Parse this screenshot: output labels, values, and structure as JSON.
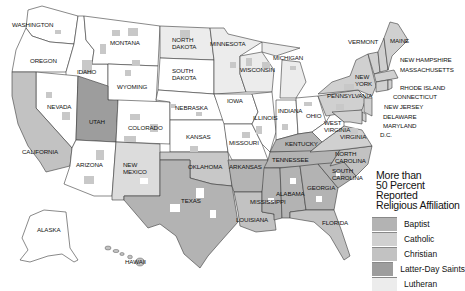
{
  "map": {
    "title": "More than 50 Percent Reported Religious Affiliation",
    "colors": {
      "background": "#ffffff",
      "base": "#ffffff",
      "baptist": "#b3b3b3",
      "catholic": "#d0d0d0",
      "christian": "#c2c2c2",
      "latter_day_saints": "#9d9d9d",
      "lutheran": "#ececec",
      "border": "#3a3a3a"
    },
    "state_labels": [
      {
        "name": "WASHINGTON",
        "x": 12,
        "y": 27
      },
      {
        "name": "OREGON",
        "x": 30,
        "y": 63
      },
      {
        "name": "IDAHO",
        "x": 77,
        "y": 74
      },
      {
        "name": "MONTANA",
        "x": 110,
        "y": 45
      },
      {
        "name": "WYOMING",
        "x": 117,
        "y": 89
      },
      {
        "name": "NEVADA",
        "x": 47,
        "y": 109
      },
      {
        "name": "UTAH",
        "x": 89,
        "y": 124
      },
      {
        "name": "CALIFORNIA",
        "x": 22,
        "y": 154
      },
      {
        "name": "ARIZONA",
        "x": 76,
        "y": 167
      },
      {
        "name": "COLORADO",
        "x": 128,
        "y": 130
      },
      {
        "name": "NEW MEXICO",
        "x": 123,
        "y": 167
      },
      {
        "name": "NORTH DAKOTA",
        "x": 172,
        "y": 42
      },
      {
        "name": "SOUTH DAKOTA",
        "x": 172,
        "y": 73
      },
      {
        "name": "NEBRASKA",
        "x": 175,
        "y": 110
      },
      {
        "name": "KANSAS",
        "x": 186,
        "y": 139
      },
      {
        "name": "OKLAHOMA",
        "x": 188,
        "y": 169
      },
      {
        "name": "TEXAS",
        "x": 181,
        "y": 203
      },
      {
        "name": "MINNESOTA",
        "x": 210,
        "y": 46
      },
      {
        "name": "IOWA",
        "x": 227,
        "y": 103
      },
      {
        "name": "MISSOURI",
        "x": 229,
        "y": 145
      },
      {
        "name": "ARKANSAS",
        "x": 229,
        "y": 169
      },
      {
        "name": "LOUISIANA",
        "x": 236,
        "y": 222
      },
      {
        "name": "WISCONSIN",
        "x": 240,
        "y": 72
      },
      {
        "name": "ILLINOIS",
        "x": 253,
        "y": 120
      },
      {
        "name": "MICHIGAN",
        "x": 273,
        "y": 60
      },
      {
        "name": "INDIANA",
        "x": 278,
        "y": 113
      },
      {
        "name": "OHIO",
        "x": 306,
        "y": 118
      },
      {
        "name": "KENTUCKY",
        "x": 285,
        "y": 146
      },
      {
        "name": "TENNESSEE",
        "x": 272,
        "y": 162
      },
      {
        "name": "MISSISSIPPI",
        "x": 250,
        "y": 204
      },
      {
        "name": "ALABAMA",
        "x": 276,
        "y": 196
      },
      {
        "name": "GEORGIA",
        "x": 307,
        "y": 190
      },
      {
        "name": "FLORIDA",
        "x": 322,
        "y": 225
      },
      {
        "name": "SOUTH CAROLINA",
        "x": 332,
        "y": 173
      },
      {
        "name": "NORTH CAROLINA",
        "x": 335,
        "y": 156
      },
      {
        "name": "VIRGINIA",
        "x": 340,
        "y": 139
      },
      {
        "name": "WEST VIRGINIA",
        "x": 324,
        "y": 125
      },
      {
        "name": "PENNSYLVANIA",
        "x": 327,
        "y": 98
      },
      {
        "name": "NEW YORK",
        "x": 355,
        "y": 79
      },
      {
        "name": "VERMONT",
        "x": 348,
        "y": 44
      },
      {
        "name": "MAINE",
        "x": 390,
        "y": 43
      },
      {
        "name": "NEW HAMPSHIRE",
        "x": 400,
        "y": 62
      },
      {
        "name": "MASSACHUSETTS",
        "x": 400,
        "y": 72
      },
      {
        "name": "RHODE ISLAND",
        "x": 400,
        "y": 90
      },
      {
        "name": "CONNECTICUT",
        "x": 393,
        "y": 99
      },
      {
        "name": "NEW JERSEY",
        "x": 384,
        "y": 109
      },
      {
        "name": "DELAWARE",
        "x": 383,
        "y": 119
      },
      {
        "name": "MARYLAND",
        "x": 383,
        "y": 128
      },
      {
        "name": "D.C.",
        "x": 380,
        "y": 137
      },
      {
        "name": "ALASKA",
        "x": 37,
        "y": 232
      },
      {
        "name": "HAWAII",
        "x": 125,
        "y": 264
      }
    ]
  },
  "legend": {
    "title_lines": [
      "More than",
      "50 Percent Reported",
      "Religious Affiliation"
    ],
    "items": [
      {
        "label": "Baptist",
        "color": "#b3b3b3"
      },
      {
        "label": "Catholic",
        "color": "#d0d0d0"
      },
      {
        "label": "Christian",
        "color": "#c2c2c2"
      },
      {
        "label": "Latter-Day Saints",
        "color": "#9d9d9d"
      },
      {
        "label": "Lutheran",
        "color": "#ececec"
      }
    ]
  }
}
